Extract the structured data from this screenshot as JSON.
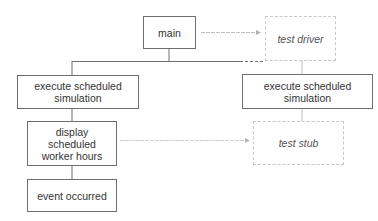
{
  "diagram": {
    "type": "module-hierarchy",
    "nodes": [
      {
        "id": "main",
        "label": "main",
        "style": "solid"
      },
      {
        "id": "test_driver",
        "label": "test driver",
        "style": "dashed"
      },
      {
        "id": "exec_left",
        "label": "execute scheduled simulation",
        "style": "solid"
      },
      {
        "id": "exec_right",
        "label": "execute scheduled simulation",
        "style": "solid"
      },
      {
        "id": "display",
        "label": "display scheduled worker hours",
        "style": "solid"
      },
      {
        "id": "event",
        "label": "event occurred",
        "style": "solid"
      },
      {
        "id": "test_stub",
        "label": "test stub",
        "style": "dashed"
      }
    ],
    "edges": [
      {
        "from": "main",
        "to": "exec_left",
        "style": "solid"
      },
      {
        "from": "main",
        "to": "test_driver",
        "style": "dashed-arrow"
      },
      {
        "from": "main",
        "to": "exec_right",
        "style": "solid-to-dashed"
      },
      {
        "from": "test_driver",
        "to": "exec_right",
        "style": "solid"
      },
      {
        "from": "exec_left",
        "to": "display",
        "style": "solid"
      },
      {
        "from": "display",
        "to": "event",
        "style": "solid"
      },
      {
        "from": "display",
        "to": "test_stub",
        "style": "dashed-arrow"
      },
      {
        "from": "exec_right",
        "to": "test_stub",
        "style": "solid"
      }
    ],
    "colors": {
      "solid_border": "#6f6f6f",
      "dashed_border": "#c8c8c8",
      "text": "#333333"
    }
  },
  "labels": {
    "main": "main",
    "test_driver": "test driver",
    "exec_left_l1": "execute scheduled",
    "exec_left_l2": "simulation",
    "exec_right_l1": "execute scheduled",
    "exec_right_l2": "simulation",
    "display_l1": "display",
    "display_l2": "scheduled",
    "display_l3": "worker hours",
    "event": "event occurred",
    "test_stub": "test stub"
  }
}
